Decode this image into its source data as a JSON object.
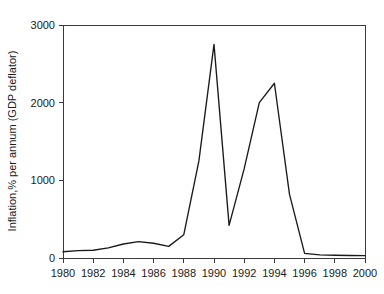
{
  "chart_data": {
    "type": "line",
    "title": "",
    "xlabel": "",
    "ylabel": "Inflation,% per annum (GDP deflator)",
    "xlim": [
      1980,
      2000
    ],
    "ylim": [
      0,
      3000
    ],
    "grid": false,
    "legend": null,
    "x_ticks": [
      1980,
      1982,
      1984,
      1986,
      1988,
      1990,
      1992,
      1994,
      1996,
      1998,
      2000
    ],
    "x_tick_labels": [
      "1980",
      "1982",
      "1984",
      "1986",
      "1988",
      "1990",
      "1992",
      "1994",
      "1996",
      "1998",
      "2000"
    ],
    "x_minor_ticks": [
      1981,
      1983,
      1985,
      1987,
      1989,
      1991,
      1993,
      1995,
      1997,
      1999
    ],
    "y_ticks": [
      0,
      1000,
      2000,
      3000
    ],
    "y_tick_labels": [
      "0",
      "1000",
      "2000",
      "3000"
    ],
    "line_color": "#1a1a1a",
    "series": [
      {
        "name": "Inflation, % per annum (GDP deflator)",
        "x": [
          1980,
          1981,
          1982,
          1983,
          1984,
          1985,
          1986,
          1987,
          1988,
          1989,
          1990,
          1991,
          1992,
          1993,
          1994,
          1995,
          1996,
          1997,
          1998,
          1999,
          2000
        ],
        "values": [
          80,
          95,
          100,
          130,
          180,
          210,
          190,
          150,
          300,
          1250,
          2750,
          420,
          1150,
          2000,
          2250,
          820,
          60,
          40,
          35,
          32,
          30
        ]
      }
    ]
  },
  "figure": {
    "background_color": "#ffffff",
    "axis_color": "#3a3a3a"
  }
}
